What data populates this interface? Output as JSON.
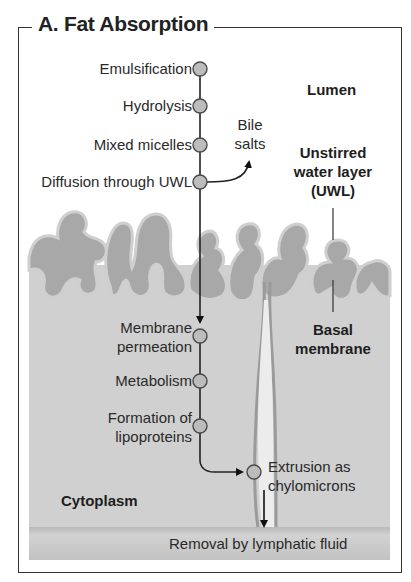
{
  "title": "A. Fat Absorption",
  "regions": {
    "lumen": "Lumen",
    "uwl_line1": "Unstirred",
    "uwl_line2": "water layer",
    "uwl_line3": "(UWL)",
    "basal_line1": "Basal",
    "basal_line2": "membrane",
    "cytoplasm": "Cytoplasm"
  },
  "steps": [
    {
      "label": "Emulsification"
    },
    {
      "label": "Hydrolysis"
    },
    {
      "label": "Mixed micelles"
    },
    {
      "label": "Diffusion through UWL"
    },
    {
      "label_line1": "Membrane",
      "label_line2": "permeation"
    },
    {
      "label": "Metabolism"
    },
    {
      "label_line1": "Formation of",
      "label_line2": "lipoproteins"
    },
    {
      "label_line1": "Extrusion as",
      "label_line2": "chylomicrons"
    }
  ],
  "side_output": {
    "line1": "Bile",
    "line2": "salts"
  },
  "bottom_bar": "Removal by lymphatic fluid",
  "colors": {
    "cytoplasm": "#cfcfcf",
    "villus_fill": "#a9a9a9",
    "villus_border": "#8f8f8f",
    "node_fill": "#bdbdbd",
    "node_stroke": "#555555",
    "lymph_bar": "#c4c4c4",
    "frame": "#333333"
  }
}
